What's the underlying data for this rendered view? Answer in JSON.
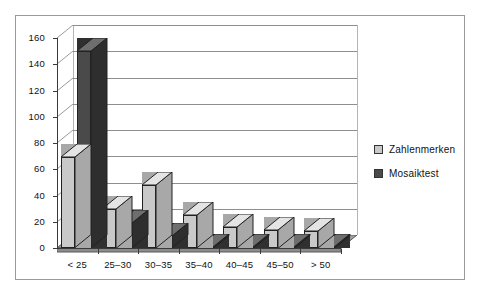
{
  "chart_data": {
    "type": "bar",
    "title": "",
    "subtitle": "",
    "xlabel": "",
    "ylabel": "",
    "categories": [
      "< 25",
      "25–30",
      "30–35",
      "35–40",
      "40–45",
      "45–50",
      "> 50"
    ],
    "series": [
      {
        "name": "Zahlenmerken",
        "color": "#c9c9c9",
        "values": [
          69,
          30,
          48,
          25,
          16,
          14,
          13
        ]
      },
      {
        "name": "Mosaiktest",
        "color": "#4a4a4a",
        "values": [
          150,
          19,
          9,
          1,
          1,
          1,
          1
        ]
      }
    ],
    "ylim": [
      0,
      160
    ],
    "ytick_step": 20,
    "yticks": [
      "0",
      "20",
      "40",
      "60",
      "80",
      "100",
      "120",
      "140",
      "160"
    ],
    "grid": true,
    "legend_position": "right",
    "style": "3d-column"
  },
  "legend": {
    "items": [
      {
        "label": "Zahlenmerken",
        "swatch": "light-gray-swatch"
      },
      {
        "label": "Mosaiktest",
        "swatch": "dark-gray-swatch"
      }
    ]
  },
  "colors": {
    "series_light": "#c9c9c9",
    "series_dark": "#4a4a4a",
    "frame_border": "#9a9a9a",
    "gridline": "#8e8e8e",
    "floor": "#9e9e9e"
  }
}
